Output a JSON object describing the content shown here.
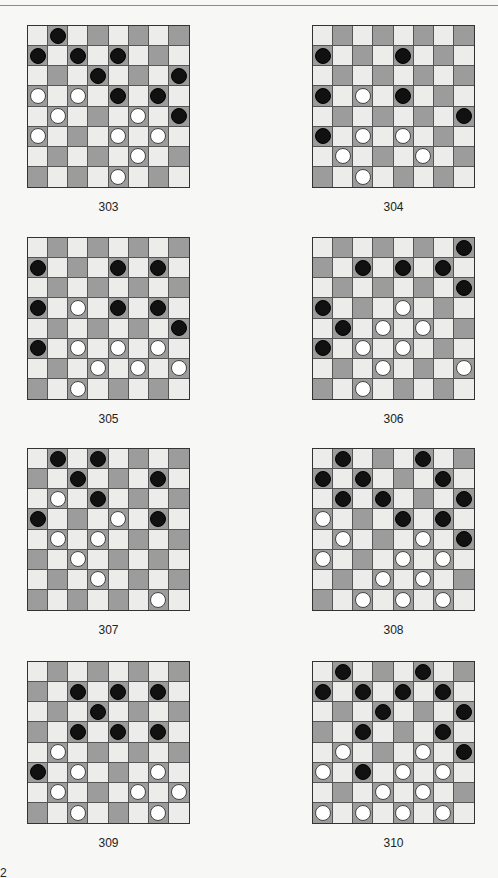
{
  "page": {
    "page_number_fragment": "2",
    "colors": {
      "dark_square": "#9c9c9c",
      "light_square": "#ececea",
      "black_piece": "#111111",
      "white_piece": "#ffffff"
    }
  },
  "diagrams": [
    {
      "label": "303",
      "x": 27,
      "y": 25,
      "black": [
        [
          0,
          1
        ],
        [
          1,
          0
        ],
        [
          1,
          2
        ],
        [
          1,
          4
        ],
        [
          2,
          3
        ],
        [
          2,
          7
        ],
        [
          3,
          4
        ],
        [
          3,
          6
        ],
        [
          4,
          7
        ]
      ],
      "white": [
        [
          3,
          0
        ],
        [
          3,
          2
        ],
        [
          4,
          1
        ],
        [
          4,
          5
        ],
        [
          5,
          0
        ],
        [
          5,
          4
        ],
        [
          5,
          6
        ],
        [
          6,
          5
        ],
        [
          7,
          4
        ]
      ]
    },
    {
      "label": "304",
      "x": 312,
      "y": 25,
      "black": [
        [
          1,
          0
        ],
        [
          1,
          4
        ],
        [
          3,
          0
        ],
        [
          3,
          4
        ],
        [
          4,
          7
        ],
        [
          5,
          0
        ]
      ],
      "white": [
        [
          3,
          2
        ],
        [
          5,
          2
        ],
        [
          5,
          4
        ],
        [
          6,
          1
        ],
        [
          6,
          5
        ],
        [
          7,
          2
        ]
      ]
    },
    {
      "label": "305",
      "x": 27,
      "y": 237,
      "black": [
        [
          1,
          0
        ],
        [
          1,
          4
        ],
        [
          1,
          6
        ],
        [
          3,
          0
        ],
        [
          3,
          4
        ],
        [
          3,
          6
        ],
        [
          4,
          7
        ],
        [
          5,
          0
        ]
      ],
      "white": [
        [
          3,
          2
        ],
        [
          5,
          2
        ],
        [
          5,
          4
        ],
        [
          5,
          6
        ],
        [
          6,
          3
        ],
        [
          6,
          5
        ],
        [
          6,
          7
        ],
        [
          7,
          2
        ]
      ]
    },
    {
      "label": "306",
      "x": 312,
      "y": 237,
      "black": [
        [
          0,
          7
        ],
        [
          1,
          2
        ],
        [
          1,
          4
        ],
        [
          1,
          6
        ],
        [
          2,
          7
        ],
        [
          3,
          0
        ],
        [
          4,
          1
        ],
        [
          5,
          0
        ]
      ],
      "white": [
        [
          3,
          4
        ],
        [
          4,
          3
        ],
        [
          4,
          5
        ],
        [
          5,
          2
        ],
        [
          5,
          4
        ],
        [
          6,
          3
        ],
        [
          6,
          7
        ],
        [
          7,
          2
        ]
      ]
    },
    {
      "label": "307",
      "x": 27,
      "y": 448,
      "black": [
        [
          0,
          1
        ],
        [
          0,
          3
        ],
        [
          1,
          2
        ],
        [
          1,
          6
        ],
        [
          2,
          3
        ],
        [
          3,
          0
        ],
        [
          3,
          6
        ]
      ],
      "white": [
        [
          2,
          1
        ],
        [
          3,
          4
        ],
        [
          4,
          1
        ],
        [
          4,
          3
        ],
        [
          5,
          2
        ],
        [
          6,
          3
        ],
        [
          7,
          6
        ]
      ]
    },
    {
      "label": "308",
      "x": 312,
      "y": 448,
      "black": [
        [
          0,
          1
        ],
        [
          0,
          5
        ],
        [
          1,
          0
        ],
        [
          1,
          2
        ],
        [
          1,
          6
        ],
        [
          2,
          1
        ],
        [
          2,
          3
        ],
        [
          2,
          7
        ],
        [
          3,
          4
        ],
        [
          3,
          6
        ],
        [
          4,
          7
        ]
      ],
      "white": [
        [
          3,
          0
        ],
        [
          4,
          1
        ],
        [
          4,
          5
        ],
        [
          5,
          0
        ],
        [
          5,
          4
        ],
        [
          5,
          6
        ],
        [
          6,
          3
        ],
        [
          6,
          5
        ],
        [
          7,
          2
        ],
        [
          7,
          4
        ],
        [
          7,
          6
        ]
      ]
    },
    {
      "label": "309",
      "x": 27,
      "y": 661,
      "black": [
        [
          1,
          2
        ],
        [
          1,
          4
        ],
        [
          1,
          6
        ],
        [
          2,
          3
        ],
        [
          3,
          2
        ],
        [
          3,
          4
        ],
        [
          3,
          6
        ],
        [
          5,
          0
        ]
      ],
      "white": [
        [
          4,
          1
        ],
        [
          5,
          2
        ],
        [
          5,
          6
        ],
        [
          6,
          1
        ],
        [
          6,
          5
        ],
        [
          6,
          7
        ],
        [
          7,
          2
        ],
        [
          7,
          6
        ]
      ]
    },
    {
      "label": "310",
      "x": 312,
      "y": 661,
      "black": [
        [
          0,
          1
        ],
        [
          0,
          5
        ],
        [
          1,
          0
        ],
        [
          1,
          2
        ],
        [
          1,
          4
        ],
        [
          1,
          6
        ],
        [
          2,
          3
        ],
        [
          2,
          7
        ],
        [
          3,
          2
        ],
        [
          3,
          6
        ],
        [
          4,
          7
        ],
        [
          5,
          2
        ]
      ],
      "white": [
        [
          4,
          1
        ],
        [
          4,
          5
        ],
        [
          5,
          0
        ],
        [
          5,
          4
        ],
        [
          5,
          6
        ],
        [
          6,
          3
        ],
        [
          6,
          5
        ],
        [
          7,
          0
        ],
        [
          7,
          2
        ],
        [
          7,
          4
        ],
        [
          7,
          6
        ]
      ]
    }
  ]
}
